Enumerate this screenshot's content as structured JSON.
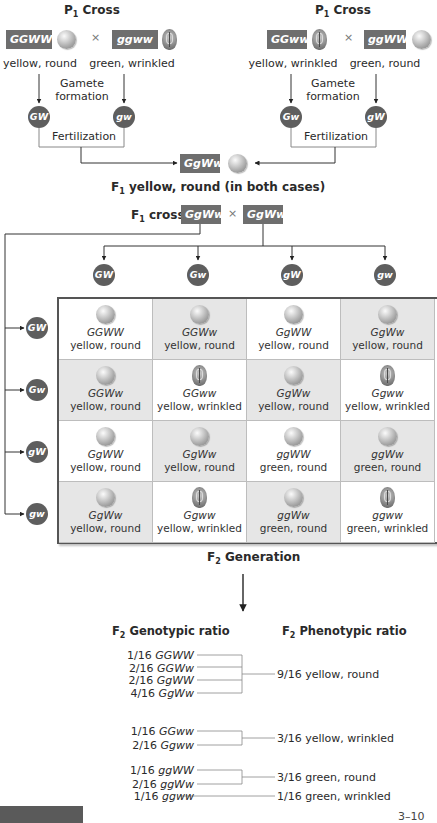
{
  "p1_crosses": [
    {
      "title_prefix": "P",
      "title_sub": "1",
      "title_suffix": " Cross",
      "parent_a": {
        "genotype": "GGWW",
        "phenotype": "yellow, round",
        "pea": "round"
      },
      "parent_b": {
        "genotype": "ggww",
        "phenotype": "green, wrinkled",
        "pea": "wrinkled"
      },
      "cross_symbol": "×",
      "gamete_label_line1": "Gamete",
      "gamete_label_line2": "formation",
      "gamete_a": "GW",
      "gamete_b": "gw",
      "fertilization_label": "Fertilization"
    },
    {
      "title_prefix": "P",
      "title_sub": "1",
      "title_suffix": " Cross",
      "parent_a": {
        "genotype": "GGww",
        "phenotype": "yellow, wrinkled",
        "pea": "wrinkled"
      },
      "parent_b": {
        "genotype": "ggWW",
        "phenotype": "green, round",
        "pea": "round"
      },
      "cross_symbol": "×",
      "gamete_label_line1": "Gamete",
      "gamete_label_line2": "formation",
      "gamete_a": "Gw",
      "gamete_b": "gW",
      "fertilization_label": "Fertilization"
    }
  ],
  "f1": {
    "genotype": "GgWw",
    "label_prefix": "F",
    "label_sub": "1",
    "label_suffix": " yellow, round (in both cases)"
  },
  "f1_cross": {
    "label_prefix": "F",
    "label_sub": "1",
    "label_suffix": " cross",
    "parent_a": "GgWw",
    "parent_b": "GgWw",
    "cross_symbol": "×"
  },
  "punnett": {
    "column_gametes": [
      "GW",
      "Gw",
      "gW",
      "gw"
    ],
    "row_gametes": [
      "GW",
      "Gw",
      "gW",
      "gw"
    ],
    "cells": [
      [
        {
          "genotype": "GGWW",
          "phenotype": "yellow, round",
          "pea": "round"
        },
        {
          "genotype": "GGWw",
          "phenotype": "yellow, round",
          "pea": "round"
        },
        {
          "genotype": "GgWW",
          "phenotype": "yellow, round",
          "pea": "round"
        },
        {
          "genotype": "GgWw",
          "phenotype": "yellow, round",
          "pea": "round"
        }
      ],
      [
        {
          "genotype": "GGWw",
          "phenotype": "yellow, round",
          "pea": "round"
        },
        {
          "genotype": "GGww",
          "phenotype": "yellow, wrinkled",
          "pea": "wrinkled"
        },
        {
          "genotype": "GgWw",
          "phenotype": "yellow, round",
          "pea": "round"
        },
        {
          "genotype": "Ggww",
          "phenotype": "yellow, wrinkled",
          "pea": "wrinkled"
        }
      ],
      [
        {
          "genotype": "GgWW",
          "phenotype": "yellow, round",
          "pea": "round"
        },
        {
          "genotype": "GgWw",
          "phenotype": "yellow, round",
          "pea": "round"
        },
        {
          "genotype": "ggWW",
          "phenotype": "green, round",
          "pea": "round"
        },
        {
          "genotype": "ggWw",
          "phenotype": "green, round",
          "pea": "round"
        }
      ],
      [
        {
          "genotype": "GgWw",
          "phenotype": "yellow, round",
          "pea": "round"
        },
        {
          "genotype": "Ggww",
          "phenotype": "yellow, wrinkled",
          "pea": "wrinkled"
        },
        {
          "genotype": "ggWw",
          "phenotype": "green, round",
          "pea": "round"
        },
        {
          "genotype": "ggww",
          "phenotype": "green, wrinkled",
          "pea": "wrinkled"
        }
      ]
    ],
    "caption_prefix": "F",
    "caption_sub": "2",
    "caption_suffix": " Generation"
  },
  "ratios": {
    "genotypic_header_prefix": "F",
    "genotypic_header_sub": "2",
    "genotypic_header_suffix": " Genotypic ratio",
    "phenotypic_header_prefix": "F",
    "phenotypic_header_sub": "2",
    "phenotypic_header_suffix": " Phenotypic ratio",
    "groups": [
      {
        "genotypes": [
          {
            "fraction": "1/16",
            "genotype": "GGWW"
          },
          {
            "fraction": "2/16",
            "genotype": "GGWw"
          },
          {
            "fraction": "2/16",
            "genotype": "GgWW"
          },
          {
            "fraction": "4/16",
            "genotype": "GgWw"
          }
        ],
        "phenotype": "9/16 yellow, round"
      },
      {
        "genotypes": [
          {
            "fraction": "1/16",
            "genotype": "GGww"
          },
          {
            "fraction": "2/16",
            "genotype": "Ggww"
          }
        ],
        "phenotype": "3/16 yellow, wrinkled"
      },
      {
        "genotypes": [
          {
            "fraction": "1/16",
            "genotype": "ggWW"
          },
          {
            "fraction": "2/16",
            "genotype": "ggWw"
          }
        ],
        "phenotype": "3/16 green, round"
      },
      {
        "genotypes": [
          {
            "fraction": "1/16",
            "genotype": "ggww"
          }
        ],
        "phenotype": "1/16 green, wrinkled"
      }
    ]
  },
  "page_number": "3–10",
  "colors": {
    "badge": "#6e6e6e",
    "gamete": "#5e5e5e",
    "cell_shade": "#e6e6e6",
    "line": "#555555"
  }
}
